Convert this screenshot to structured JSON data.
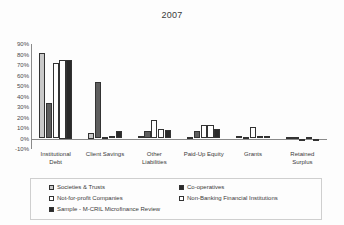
{
  "chart_data": {
    "type": "bar",
    "title": "2007",
    "xlabel": "",
    "ylabel": "",
    "ylim": [
      -10,
      90
    ],
    "ytick_labels": [
      "90%",
      "80%",
      "70%",
      "60%",
      "50%",
      "40%",
      "30%",
      "20%",
      "10%",
      "0%",
      "-10%"
    ],
    "ytick_values": [
      90,
      80,
      70,
      60,
      50,
      40,
      30,
      20,
      10,
      0,
      -10
    ],
    "grid": false,
    "legend_position": "bottom",
    "categories": [
      "Institutional\nDebt",
      "Client Savings",
      "Other\nLiabilities",
      "Paid-Up Equity",
      "Grants",
      "Retained\nSurplus"
    ],
    "series": [
      {
        "name": "Societies & Trusts",
        "color": "#c9c9c9",
        "values": [
          81,
          5,
          2,
          1,
          2,
          1
        ]
      },
      {
        "name": "Not-for-profit Companies",
        "color": "#ffffff",
        "values": [
          72,
          1,
          18,
          13,
          11,
          0
        ]
      },
      {
        "name": "Sample - M-CRIL Microfinance Review",
        "color": "#2a2a2a",
        "values": [
          75,
          7,
          8,
          9,
          2,
          -2
        ]
      },
      {
        "name": "Co-operatives",
        "color": "#5e5e5e",
        "values": [
          34,
          54,
          7,
          7,
          1,
          1
        ]
      },
      {
        "name": "Non-Banking Financial Institutions",
        "color": "#ffffff",
        "values": [
          75,
          2,
          9,
          13,
          2,
          1
        ]
      }
    ],
    "plot_series_order": [
      "Societies & Trusts",
      "Co-operatives",
      "Not-for-profit Companies",
      "Non-Banking Financial Institutions",
      "Sample - M-CRIL Microfinance Review"
    ]
  },
  "legend": {
    "items": [
      {
        "label": "Societies & Trusts",
        "swatch": "#c9c9c9",
        "col": 0,
        "row": 0
      },
      {
        "label": "Co-operatives",
        "swatch": "#2a2a2a",
        "col": 1,
        "row": 0
      },
      {
        "label": "Not-for-profit Companies",
        "swatch": "#ffffff",
        "col": 0,
        "row": 1
      },
      {
        "label": "Non-Banking Financial Institutions",
        "swatch": "#ffffff",
        "col": 1,
        "row": 1
      },
      {
        "label": "Sample - M-CRIL Microfinance Review",
        "swatch": "#2a2a2a",
        "col": 0,
        "row": 2
      }
    ]
  }
}
